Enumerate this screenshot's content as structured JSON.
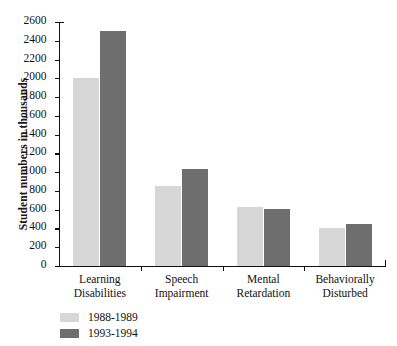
{
  "chart_data": {
    "type": "bar",
    "title": "",
    "xlabel": "",
    "ylabel": "Student numbers in thousands",
    "ylim": [
      0,
      2600
    ],
    "ytick_step": 200,
    "grid": false,
    "legend_position": "bottom-left",
    "categories": [
      "Learning Disabilities",
      "Speech Impairment",
      "Mental Retardation",
      "Behaviorally Disturbed"
    ],
    "category_lines": [
      [
        "Learning",
        "Disabilities"
      ],
      [
        "Speech",
        "Impairment"
      ],
      [
        "Mental",
        "Retardation"
      ],
      [
        "Behaviorally",
        "Disturbed"
      ]
    ],
    "ytick_labels": [
      "0",
      "200",
      "400",
      "600",
      "800",
      "1000",
      "1200",
      "1400",
      "1600",
      "1800",
      "2000",
      "2200",
      "2400",
      "2600"
    ],
    "series": [
      {
        "name": "1988-1989",
        "color": "#d7d7d7",
        "values": [
          2000,
          850,
          630,
          400
        ]
      },
      {
        "name": "1993-1994",
        "color": "#6e6e6e",
        "values": [
          2500,
          1030,
          610,
          450
        ]
      }
    ]
  },
  "legend": {
    "items": [
      {
        "label": "1988-1989",
        "color": "#d7d7d7"
      },
      {
        "label": "1993-1994",
        "color": "#6e6e6e"
      }
    ]
  },
  "axis": {
    "y_title": "Student numbers in thousands"
  }
}
